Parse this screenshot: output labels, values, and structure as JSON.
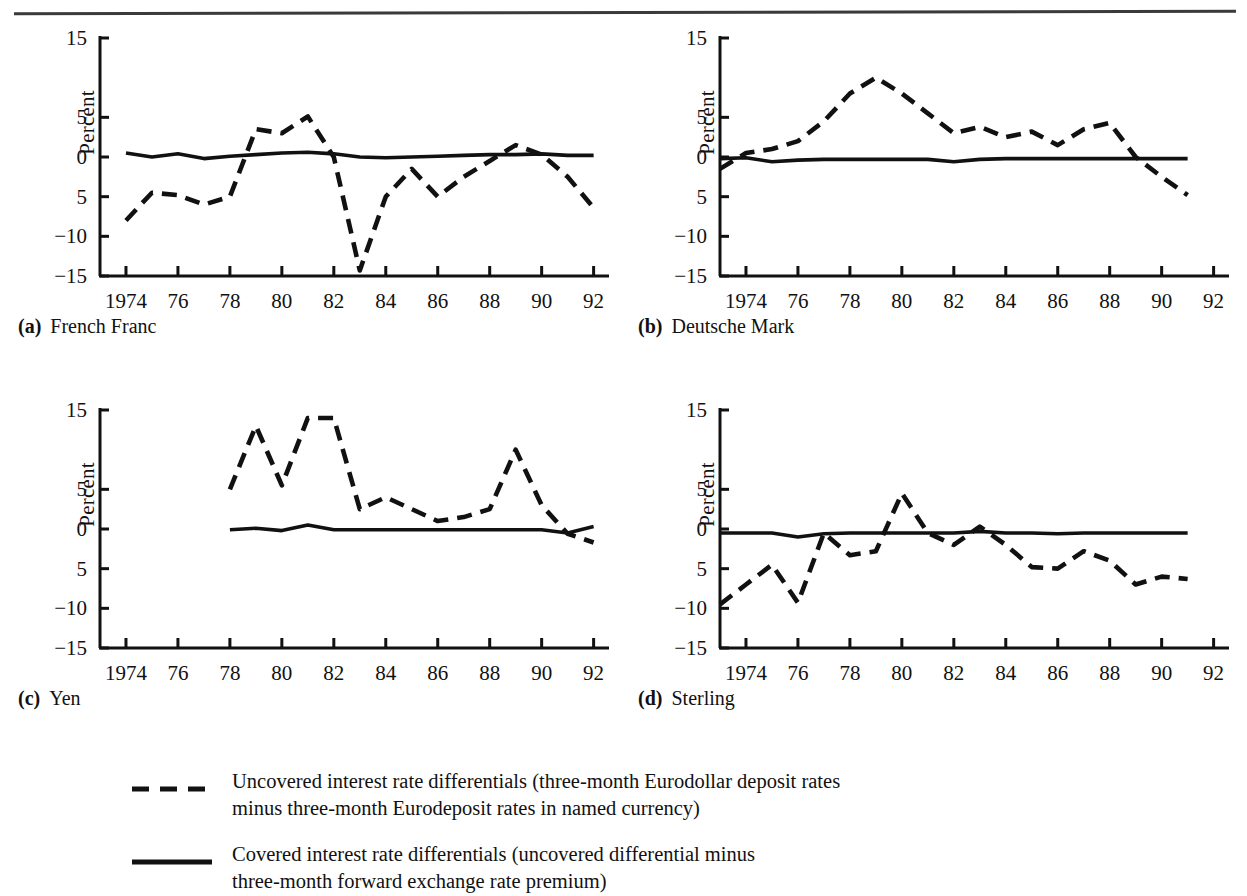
{
  "figure": {
    "ylabel": "Percent",
    "y_ticks": [
      {
        "value": 15,
        "label": "15"
      },
      {
        "value": 5,
        "label": "5"
      },
      {
        "value": 0,
        "label": "0"
      },
      {
        "value": -5,
        "label": "5"
      },
      {
        "value": -10,
        "label": "−10"
      },
      {
        "value": -15,
        "label": "−15"
      }
    ],
    "x_ticks": [
      {
        "value": 1974,
        "label": "1974"
      },
      {
        "value": 1976,
        "label": "76"
      },
      {
        "value": 1978,
        "label": "78"
      },
      {
        "value": 1980,
        "label": "80"
      },
      {
        "value": 1982,
        "label": "82"
      },
      {
        "value": 1984,
        "label": "84"
      },
      {
        "value": 1986,
        "label": "86"
      },
      {
        "value": 1988,
        "label": "88"
      },
      {
        "value": 1990,
        "label": "90"
      },
      {
        "value": 1992,
        "label": "92"
      }
    ]
  },
  "panels": [
    {
      "key": "a",
      "letter": "(a)",
      "title": "French Franc"
    },
    {
      "key": "b",
      "letter": "(b)",
      "title": "Deutsche Mark"
    },
    {
      "key": "c",
      "letter": "(c)",
      "title": "Yen"
    },
    {
      "key": "d",
      "letter": "(d)",
      "title": "Sterling"
    }
  ],
  "legend": {
    "items": [
      {
        "style": "dashed",
        "label": "Uncovered interest rate differentials (three-month Eurodollar deposit rates\nminus three-month Eurodeposit rates in named currency)"
      },
      {
        "style": "solid",
        "label": "Covered interest rate differentials (uncovered differential minus\nthree-month forward exchange rate premium)"
      }
    ]
  },
  "chart_data": [
    {
      "type": "line",
      "panel": "a",
      "title": "French Franc",
      "xlabel": "",
      "ylabel": "Percent",
      "xlim": [
        1973,
        1992
      ],
      "ylim": [
        -15,
        15
      ],
      "grid": false,
      "legend_position": "below-figure",
      "series": [
        {
          "name": "Uncovered interest rate differentials",
          "style": "dashed",
          "x": [
            1974,
            1975,
            1976,
            1977,
            1978,
            1979,
            1980,
            1981,
            1982,
            1983,
            1984,
            1985,
            1986,
            1987,
            1988,
            1989,
            1990,
            1991,
            1992
          ],
          "values": [
            -8.0,
            -4.5,
            -4.8,
            -6.0,
            -5.0,
            3.5,
            3.0,
            5.1,
            0.0,
            -14.3,
            -5.0,
            -1.5,
            -5.0,
            -2.5,
            -0.5,
            1.5,
            0.3,
            -2.5,
            -6.4
          ]
        },
        {
          "name": "Covered interest rate differentials",
          "style": "solid",
          "x": [
            1974,
            1975,
            1976,
            1977,
            1978,
            1979,
            1980,
            1981,
            1982,
            1983,
            1984,
            1985,
            1986,
            1987,
            1988,
            1989,
            1990,
            1991,
            1992
          ],
          "values": [
            0.5,
            0.0,
            0.4,
            -0.2,
            0.1,
            0.3,
            0.5,
            0.6,
            0.4,
            0.0,
            -0.1,
            0.0,
            0.1,
            0.2,
            0.3,
            0.3,
            0.4,
            0.2,
            0.2
          ]
        }
      ]
    },
    {
      "type": "line",
      "panel": "b",
      "title": "Deutsche Mark",
      "xlabel": "",
      "ylabel": "Percent",
      "xlim": [
        1973,
        1992
      ],
      "ylim": [
        -15,
        15
      ],
      "grid": false,
      "legend_position": "below-figure",
      "series": [
        {
          "name": "Uncovered interest rate differentials",
          "style": "dashed",
          "x": [
            1973,
            1974,
            1975,
            1976,
            1977,
            1978,
            1979,
            1980,
            1981,
            1982,
            1983,
            1984,
            1985,
            1986,
            1987,
            1988,
            1989,
            1990,
            1991
          ],
          "values": [
            -1.5,
            0.5,
            1.0,
            2.0,
            4.5,
            8.0,
            10.0,
            8.0,
            5.5,
            3.0,
            3.8,
            2.5,
            3.2,
            1.5,
            3.5,
            4.3,
            0.0,
            -2.5,
            -4.8
          ]
        },
        {
          "name": "Covered interest rate differentials",
          "style": "solid",
          "x": [
            1973,
            1974,
            1975,
            1976,
            1977,
            1978,
            1979,
            1980,
            1981,
            1982,
            1983,
            1984,
            1985,
            1986,
            1987,
            1988,
            1989,
            1990,
            1991
          ],
          "values": [
            -0.2,
            -0.1,
            -0.6,
            -0.4,
            -0.3,
            -0.3,
            -0.3,
            -0.3,
            -0.3,
            -0.6,
            -0.3,
            -0.2,
            -0.2,
            -0.2,
            -0.2,
            -0.2,
            -0.2,
            -0.2,
            -0.2
          ]
        }
      ]
    },
    {
      "type": "line",
      "panel": "c",
      "title": "Yen",
      "xlabel": "",
      "ylabel": "Percent",
      "xlim": [
        1973,
        1992
      ],
      "ylim": [
        -15,
        15
      ],
      "grid": false,
      "legend_position": "below-figure",
      "series": [
        {
          "name": "Uncovered interest rate differentials",
          "style": "dashed",
          "x": [
            1978,
            1979,
            1980,
            1981,
            1982,
            1983,
            1984,
            1985,
            1986,
            1987,
            1988,
            1989,
            1990,
            1991,
            1992
          ],
          "values": [
            5.0,
            13.0,
            5.5,
            14.0,
            14.0,
            2.5,
            4.0,
            2.5,
            1.0,
            1.5,
            2.5,
            10.0,
            3.0,
            -0.6,
            -1.7
          ]
        },
        {
          "name": "Covered interest rate differentials",
          "style": "solid",
          "x": [
            1978,
            1979,
            1980,
            1981,
            1982,
            1983,
            1984,
            1985,
            1986,
            1987,
            1988,
            1989,
            1990,
            1991,
            1992
          ],
          "values": [
            -0.1,
            0.1,
            -0.2,
            0.5,
            -0.1,
            -0.1,
            -0.1,
            -0.1,
            -0.1,
            -0.1,
            -0.1,
            -0.1,
            -0.1,
            -0.5,
            0.3
          ]
        }
      ]
    },
    {
      "type": "line",
      "panel": "d",
      "title": "Sterling",
      "xlabel": "",
      "ylabel": "Percent",
      "xlim": [
        1973,
        1992
      ],
      "ylim": [
        -15,
        15
      ],
      "grid": false,
      "legend_position": "below-figure",
      "series": [
        {
          "name": "Uncovered interest rate differentials",
          "style": "dashed",
          "x": [
            1973,
            1974,
            1975,
            1976,
            1977,
            1978,
            1979,
            1980,
            1981,
            1982,
            1983,
            1984,
            1985,
            1986,
            1987,
            1988,
            1989,
            1990,
            1991
          ],
          "values": [
            -9.5,
            -7.0,
            -4.5,
            -9.3,
            -0.5,
            -3.3,
            -2.8,
            4.5,
            -0.5,
            -2.0,
            0.3,
            -2.0,
            -4.8,
            -5.0,
            -2.8,
            -4.0,
            -7.0,
            -6.0,
            -6.3
          ]
        },
        {
          "name": "Covered interest rate differentials",
          "style": "solid",
          "x": [
            1973,
            1974,
            1975,
            1976,
            1977,
            1978,
            1979,
            1980,
            1981,
            1982,
            1983,
            1984,
            1985,
            1986,
            1987,
            1988,
            1989,
            1990,
            1991
          ],
          "values": [
            -0.5,
            -0.5,
            -0.5,
            -1.0,
            -0.6,
            -0.5,
            -0.5,
            -0.5,
            -0.5,
            -0.5,
            -0.3,
            -0.5,
            -0.5,
            -0.6,
            -0.5,
            -0.5,
            -0.5,
            -0.5,
            -0.5
          ]
        }
      ]
    }
  ]
}
